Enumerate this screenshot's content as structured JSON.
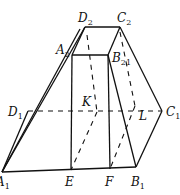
{
  "diagram": {
    "type": "geometry-frustum",
    "points": {
      "D2": {
        "label": "D",
        "sub": "2",
        "x": 85,
        "y": 27
      },
      "C2": {
        "label": "C",
        "sub": "2",
        "x": 120,
        "y": 27
      },
      "A2": {
        "label": "A",
        "sub": "2",
        "x": 72,
        "y": 55
      },
      "B2": {
        "label": "B",
        "sub": "21",
        "x": 108,
        "y": 55
      },
      "D1": {
        "label": "D",
        "sub": "1",
        "x": 28,
        "y": 111
      },
      "C1": {
        "label": "C",
        "sub": "1",
        "x": 162,
        "y": 111
      },
      "A1": {
        "label": "A",
        "sub": "1",
        "x": 2,
        "y": 172
      },
      "E": {
        "label": "E",
        "x": 71,
        "y": 170
      },
      "F": {
        "label": "F",
        "x": 110,
        "y": 169
      },
      "B1": {
        "label": "B",
        "sub": "1",
        "x": 136,
        "y": 167
      },
      "K": {
        "label": "K",
        "x": 97,
        "y": 112
      },
      "L": {
        "label": "L",
        "x": 135,
        "y": 113
      }
    },
    "labels": {
      "D2": "D",
      "D2_sub": "2",
      "C2": "C",
      "C2_sub": "2",
      "A2": "A",
      "A2_sub": "2",
      "B2": "B",
      "B2_sub": "21",
      "D1": "D",
      "D1_sub": "1",
      "C1": "C",
      "C1_sub": "1",
      "A1": "A",
      "A1_sub": "1",
      "E": "E",
      "F": "F",
      "B1": "B",
      "B1_sub": "1",
      "K": "K",
      "L": "L"
    }
  }
}
